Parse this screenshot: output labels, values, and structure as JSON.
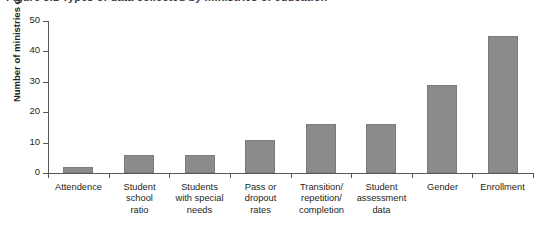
{
  "figure": {
    "title": "Figure 3.1  Types of data collected by ministries of education"
  },
  "chart_data": {
    "type": "bar",
    "title": "",
    "xlabel": "",
    "ylabel": "Number of ministries of education",
    "ylim": [
      0,
      50
    ],
    "yticks": [
      0,
      10,
      20,
      30,
      40,
      50
    ],
    "grid": false,
    "legend": false,
    "bar_color": "#8b8b8b",
    "axis_color": "#585858",
    "categories": [
      "Attendence",
      "Student school ratio",
      "Students with special needs",
      "Pass or dropout rates",
      "Transition/ repetition/ completion",
      "Student assessment data",
      "Gender",
      "Enrollment"
    ],
    "category_lines": [
      [
        "Attendence"
      ],
      [
        "Student",
        "school",
        "ratio"
      ],
      [
        "Students",
        "with special",
        "needs"
      ],
      [
        "Pass or",
        "dropout",
        "rates"
      ],
      [
        "Transition/",
        "repetition/",
        "completion"
      ],
      [
        "Student",
        "assessment",
        "data"
      ],
      [
        "Gender"
      ],
      [
        "Enrollment"
      ]
    ],
    "values": [
      2,
      6,
      6,
      11,
      16,
      16,
      29,
      45
    ]
  }
}
